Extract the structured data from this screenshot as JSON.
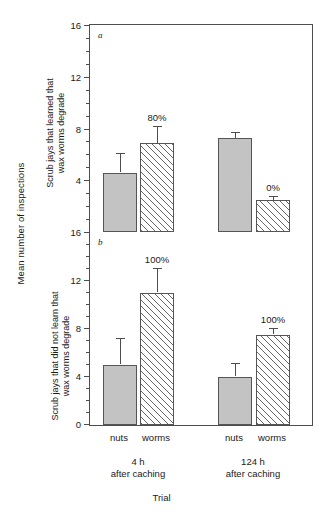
{
  "chart_data": {
    "type": "bar",
    "title": "",
    "xlabel": "Trial",
    "ylabel": "Mean number of inspections",
    "grid": false,
    "legend": "none",
    "categories": [
      "nuts",
      "worms",
      "nuts",
      "worms"
    ],
    "group_labels": [
      "4 h\nafter caching",
      "124 h\nafter caching"
    ],
    "panels": [
      {
        "letter": "a",
        "ylabel": "Scrub jays that learned that\nwax worms degrade",
        "ylim": [
          0,
          16
        ],
        "yticks": [
          0,
          4,
          8,
          12,
          16
        ],
        "ytick_labels": [
          "",
          "4",
          "8",
          "12",
          "16"
        ],
        "minor_tick_step": 1,
        "bars": [
          {
            "group": "4 h after caching",
            "category": "nuts",
            "style": "solid",
            "value": 4.6,
            "err_upper": 1.5,
            "annotation": ""
          },
          {
            "group": "4 h after caching",
            "category": "worms",
            "style": "hatch",
            "value": 6.9,
            "err_upper": 1.3,
            "annotation": "80%"
          },
          {
            "group": "124 h after caching",
            "category": "nuts",
            "style": "solid",
            "value": 7.3,
            "err_upper": 0.4,
            "annotation": ""
          },
          {
            "group": "124 h after caching",
            "category": "worms",
            "style": "hatch",
            "value": 2.5,
            "err_upper": 0.3,
            "annotation": "0%"
          }
        ]
      },
      {
        "letter": "b",
        "ylabel": "Scrub jays that did not learn that\nwax worms degrade",
        "ylim": [
          0,
          16
        ],
        "yticks": [
          0,
          4,
          8,
          12,
          16
        ],
        "ytick_labels": [
          "0",
          "4",
          "8",
          "12",
          "16"
        ],
        "minor_tick_step": 1,
        "bars": [
          {
            "group": "4 h after caching",
            "category": "nuts",
            "style": "solid",
            "value": 5.0,
            "err_upper": 2.2,
            "annotation": ""
          },
          {
            "group": "4 h after caching",
            "category": "worms",
            "style": "hatch",
            "value": 11.0,
            "err_upper": 2.0,
            "annotation": "100%"
          },
          {
            "group": "124 h after caching",
            "category": "nuts",
            "style": "solid",
            "value": 4.0,
            "err_upper": 1.1,
            "annotation": ""
          },
          {
            "group": "124 h after caching",
            "category": "worms",
            "style": "hatch",
            "value": 7.5,
            "err_upper": 0.5,
            "annotation": "100%"
          }
        ]
      }
    ],
    "colors": {
      "solid_bar": "#c3c3c3",
      "hatch_bar": "#ffffff",
      "axis": "#4d4d4d",
      "text": "#1a1a1a"
    }
  },
  "axis": {
    "outer_y_title": "Mean number of inspections",
    "x_title": "Trial"
  },
  "panel_a": {
    "letter": "a",
    "y_title_line1": "Scrub jays that learned that",
    "y_title_line2": "wax worms degrade",
    "tick_16": "16",
    "tick_12": "12",
    "tick_8": "8",
    "tick_4": "4",
    "pct_worms_4h": "80%",
    "pct_worms_124h": "0%"
  },
  "panel_b": {
    "letter": "b",
    "y_title_line1": "Scrub jays that did not learn that",
    "y_title_line2": "wax worms degrade",
    "tick_16": "16",
    "tick_12": "12",
    "tick_8": "8",
    "tick_4": "4",
    "tick_0": "0",
    "pct_worms_4h": "100%",
    "pct_worms_124h": "100%"
  },
  "xaxis": {
    "tick_nuts_1": "nuts",
    "tick_worms_1": "worms",
    "tick_nuts_2": "nuts",
    "tick_worms_2": "worms",
    "group1_line1": "4 h",
    "group1_line2": "after caching",
    "group2_line1": "124 h",
    "group2_line2": "after caching"
  }
}
